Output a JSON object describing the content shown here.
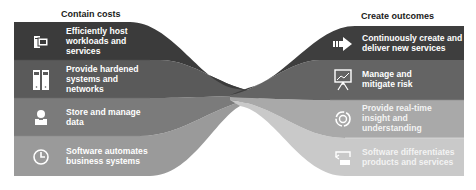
{
  "left_column": {
    "title": "Contain costs",
    "items": [
      {
        "icon": "server-workstation-icon",
        "lines": [
          "Efficiently host",
          "workloads and",
          "services"
        ],
        "color": "#3b3b3b"
      },
      {
        "icon": "server-racks-icon",
        "lines": [
          "Provide hardened",
          "systems and",
          "networks"
        ],
        "color": "#5a5a5a"
      },
      {
        "icon": "user-data-icon",
        "lines": [
          "Store and manage",
          "data"
        ],
        "color": "#7b7b7b"
      },
      {
        "icon": "clock-icon",
        "lines": [
          "Software automates",
          "business systems"
        ],
        "color": "#9a9a9a"
      }
    ]
  },
  "right_column": {
    "title": "Create outcomes",
    "items": [
      {
        "icon": "arrow-forward-icon",
        "lines": [
          "Continuously create and",
          "deliver new services"
        ],
        "color": "#3e3e3e"
      },
      {
        "icon": "presentation-chart-icon",
        "lines": [
          "Manage and",
          "mitigate risk"
        ],
        "color": "#646464"
      },
      {
        "icon": "target-cycle-icon",
        "lines": [
          "Provide real-time",
          "insight and",
          "understanding"
        ],
        "color": "#a9a9a9"
      },
      {
        "icon": "product-services-icon",
        "lines": [
          "Software differentiates",
          "products and services"
        ],
        "color": "#c9c9c9"
      }
    ]
  }
}
